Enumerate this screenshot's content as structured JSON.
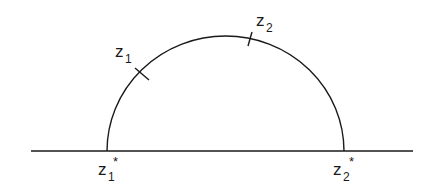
{
  "diagram": {
    "labels": {
      "z1": {
        "base": "z",
        "sub": "1",
        "sup": ""
      },
      "z2": {
        "base": "z",
        "sub": "2",
        "sup": ""
      },
      "z1_star": {
        "base": "z",
        "sub": "1",
        "sup": "*"
      },
      "z2_star": {
        "base": "z",
        "sub": "2",
        "sup": "*"
      }
    },
    "colors": {
      "stroke": "#1a1a1a",
      "background": "#ffffff"
    }
  }
}
